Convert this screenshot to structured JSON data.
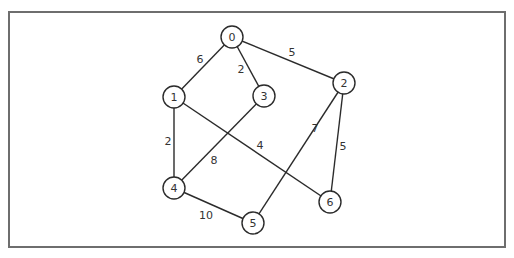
{
  "diagram": {
    "type": "weighted-undirected-graph",
    "frame": {
      "x": 9,
      "y": 12,
      "width": 496,
      "height": 235,
      "stroke": "#6e6e6e"
    },
    "node_radius": 11,
    "nodes": [
      {
        "id": "0",
        "label": "0",
        "x": 232,
        "y": 37
      },
      {
        "id": "1",
        "label": "1",
        "x": 174,
        "y": 97
      },
      {
        "id": "2",
        "label": "2",
        "x": 344,
        "y": 83
      },
      {
        "id": "3",
        "label": "3",
        "x": 264,
        "y": 96
      },
      {
        "id": "4",
        "label": "4",
        "x": 174,
        "y": 188
      },
      {
        "id": "5",
        "label": "5",
        "x": 253,
        "y": 223
      },
      {
        "id": "6",
        "label": "6",
        "x": 330,
        "y": 202
      }
    ],
    "edges": [
      {
        "from": "0",
        "to": "1",
        "weight": "6",
        "label_x": 200,
        "label_y": 59
      },
      {
        "from": "0",
        "to": "3",
        "weight": "2",
        "label_x": 241,
        "label_y": 69
      },
      {
        "from": "0",
        "to": "2",
        "weight": "5",
        "label_x": 292,
        "label_y": 52
      },
      {
        "from": "1",
        "to": "4",
        "weight": "2",
        "label_x": 168,
        "label_y": 141
      },
      {
        "from": "1",
        "to": "6",
        "weight": "4",
        "label_x": 260,
        "label_y": 145
      },
      {
        "from": "3",
        "to": "4",
        "weight": "8",
        "label_x": 214,
        "label_y": 160
      },
      {
        "from": "2",
        "to": "5",
        "weight": "7",
        "label_x": 315,
        "label_y": 128
      },
      {
        "from": "2",
        "to": "6",
        "weight": "5",
        "label_x": 343,
        "label_y": 146
      },
      {
        "from": "4",
        "to": "5",
        "weight": "10",
        "label_x": 206,
        "label_y": 215
      }
    ]
  }
}
